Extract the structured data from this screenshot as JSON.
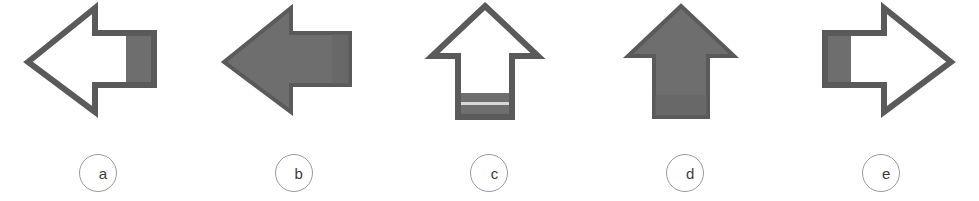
{
  "figure": {
    "background_color": "#ffffff",
    "width": 979,
    "height": 201,
    "outline_color": "#5a5a5a",
    "fill_color": "#6e6e6e",
    "label_circle_color": "#9a9a9a",
    "label_text_color": "#3c3c3c"
  },
  "items": [
    {
      "id": "a",
      "label": "a",
      "icon_name": "left-arrow-outline-icon",
      "direction": "left",
      "style": "outline",
      "shaded_region": "tail-block-right",
      "description": "Outlined left-pointing arrow with gray shaded block at the tail end"
    },
    {
      "id": "b",
      "label": "b",
      "icon_name": "left-arrow-filled-icon",
      "direction": "left",
      "style": "filled",
      "shaded_region": "whole",
      "description": "Solid gray filled left-pointing arrow"
    },
    {
      "id": "c",
      "label": "c",
      "icon_name": "up-arrow-outline-icon",
      "direction": "up",
      "style": "outline",
      "shaded_region": "tail-band-bottom",
      "description": "Outlined up-pointing arrow with gray shaded band at the bottom of the shaft"
    },
    {
      "id": "d",
      "label": "d",
      "icon_name": "up-arrow-filled-icon",
      "direction": "up",
      "style": "filled",
      "shaded_region": "whole",
      "description": "Solid gray filled up-pointing arrow"
    },
    {
      "id": "e",
      "label": "e",
      "icon_name": "right-arrow-outline-icon",
      "direction": "right",
      "style": "outline",
      "shaded_region": "tail-block-left",
      "description": "Outlined right-pointing arrow with gray shaded block at the tail end"
    }
  ]
}
